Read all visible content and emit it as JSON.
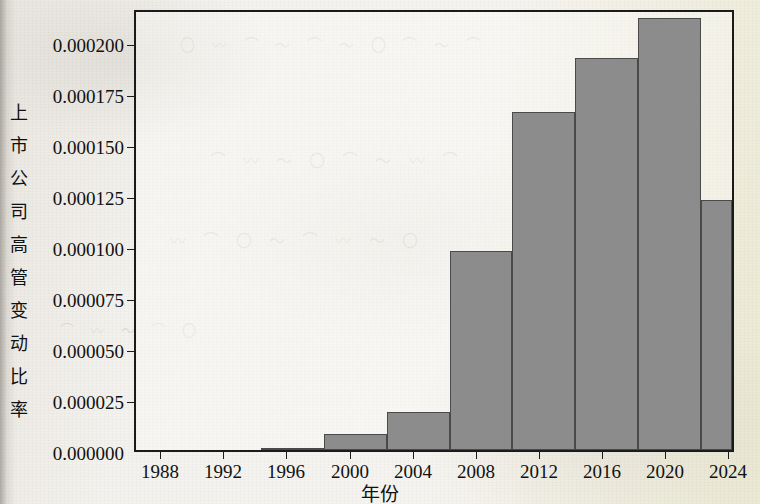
{
  "chart_data": {
    "type": "bar",
    "title": "",
    "subtitle": "",
    "xlabel": "年份",
    "ylabel": "上市公司高管变动比率",
    "xlim": [
      1986,
      2024
    ],
    "ylim": [
      0.0,
      0.00021
    ],
    "grid": false,
    "legend": null,
    "bin_width_years": 4,
    "bar_color": "#8c8c8c",
    "bar_edge_color": "#4a4a4a",
    "categories": [
      "1994-1998",
      "1998-2002",
      "2002-2006",
      "2006-2010",
      "2010-2014",
      "2014-2018",
      "2018-2022",
      "2022-2024"
    ],
    "bins": [
      {
        "start": 1994,
        "end": 1998,
        "value": 1e-06
      },
      {
        "start": 1998,
        "end": 2002,
        "value": 7.5e-06
      },
      {
        "start": 2002,
        "end": 2006,
        "value": 1.82e-05
      },
      {
        "start": 2006,
        "end": 2010,
        "value": 9.55e-05
      },
      {
        "start": 2010,
        "end": 2014,
        "value": 0.000162
      },
      {
        "start": 2014,
        "end": 2018,
        "value": 0.000188
      },
      {
        "start": 2018,
        "end": 2022,
        "value": 0.000207
      },
      {
        "start": 2022,
        "end": 2024,
        "value": 0.00012
      }
    ],
    "values": [
      1e-06,
      7.5e-06,
      1.82e-05,
      9.55e-05,
      0.000162,
      0.000188,
      0.000207,
      0.00012
    ],
    "xticks": [
      1988,
      1992,
      1996,
      2000,
      2004,
      2008,
      2012,
      2016,
      2020,
      2024
    ],
    "xticklabels": [
      "1988",
      "1992",
      "1996",
      "2000",
      "2004",
      "2008",
      "2012",
      "2016",
      "2020",
      "2024"
    ],
    "yticks": [
      0.0,
      2.5e-05,
      5e-05,
      7.5e-05,
      0.0001,
      0.000125,
      0.00015,
      0.000175,
      0.0002
    ],
    "yticklabels": [
      "0.000000",
      "0.000025",
      "0.000050",
      "0.000075",
      "0.000100",
      "0.000125",
      "0.000150",
      "0.000175",
      "0.000200"
    ]
  },
  "axis": {
    "y_title_chars": [
      "上",
      "市",
      "公",
      "司",
      "高",
      "管",
      "变",
      "动",
      "比",
      "率"
    ],
    "x_title": "年份"
  }
}
